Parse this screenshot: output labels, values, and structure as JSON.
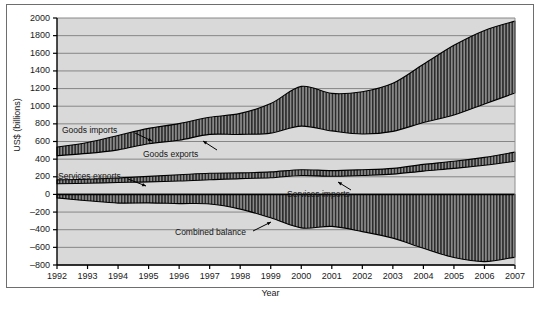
{
  "figure": {
    "ylabel": "US$ (billions)",
    "xlabel": "Year",
    "background": "#d9d9d9",
    "band_fill": "#8a8a8a",
    "hatch_color": "#2b2b2b",
    "grid_color": "#7d7d7d",
    "axis_color": "#000000"
  },
  "yticks": [
    "2000",
    "1800",
    "1600",
    "1400",
    "1200",
    "1000",
    "800",
    "600",
    "400",
    "200",
    "0",
    "-200",
    "-400",
    "-600",
    "-800"
  ],
  "xticks": [
    "1992",
    "1993",
    "1994",
    "1995",
    "1996",
    "1997",
    "1998",
    "1999",
    "2000",
    "2001",
    "2002",
    "2003",
    "2004",
    "2005",
    "2006",
    "2007"
  ],
  "annotations": [
    {
      "name": "goods-imports",
      "text": "Goods imports"
    },
    {
      "name": "goods-exports",
      "text": "Goods exports"
    },
    {
      "name": "services-exports",
      "text": "Services exports"
    },
    {
      "name": "services-imports",
      "text": "Services imports"
    },
    {
      "name": "combined-balance",
      "text": "Combined balance"
    }
  ],
  "chart_data": {
    "type": "area",
    "title": "",
    "xlabel": "Year",
    "ylabel": "US$ (billions)",
    "ylim": [
      -800,
      2000
    ],
    "ytick_step": 200,
    "grid": true,
    "legend": "inline-annotations",
    "x": [
      1992,
      1993,
      1994,
      1995,
      1996,
      1997,
      1998,
      1999,
      2000,
      2001,
      2002,
      2003,
      2004,
      2005,
      2006,
      2007
    ],
    "series": [
      {
        "name": "Goods exports",
        "values": [
          440,
          465,
          505,
          575,
          615,
          680,
          680,
          695,
          775,
          720,
          685,
          715,
          815,
          900,
          1025,
          1150
        ]
      },
      {
        "name": "Goods imports",
        "values": [
          536,
          589,
          668,
          749,
          803,
          876,
          918,
          1030,
          1225,
          1145,
          1165,
          1260,
          1475,
          1690,
          1860,
          1965
        ]
      },
      {
        "name": "Services exports",
        "values": [
          165,
          172,
          186,
          204,
          222,
          240,
          244,
          255,
          280,
          270,
          280,
          295,
          340,
          375,
          420,
          480
        ]
      },
      {
        "name": "Services imports",
        "values": [
          120,
          127,
          135,
          142,
          152,
          166,
          180,
          189,
          215,
          205,
          215,
          230,
          265,
          295,
          330,
          375
        ]
      },
      {
        "name": "Combined balance",
        "values": [
          -39,
          -72,
          -98,
          -96,
          -104,
          -108,
          -166,
          -265,
          -380,
          -362,
          -421,
          -495,
          -610,
          -715,
          -762,
          -710
        ]
      }
    ],
    "bands": [
      {
        "name": "Goods trade gap",
        "upper": "Goods imports",
        "lower": "Goods exports",
        "fill": "hatched-vertical"
      },
      {
        "name": "Services trade surplus",
        "upper": "Services exports",
        "lower": "Services imports",
        "fill": "hatched-vertical"
      },
      {
        "name": "Combined balance deficit",
        "upper": 0,
        "lower": "Combined balance",
        "fill": "hatched-vertical"
      }
    ]
  }
}
